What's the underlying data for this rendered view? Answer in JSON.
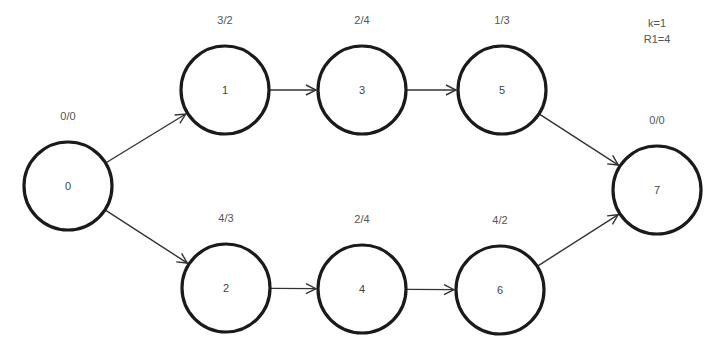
{
  "diagram": {
    "params": [
      {
        "text": "k=1",
        "x": 657,
        "y": 27
      },
      {
        "text": "R1=4",
        "x": 657,
        "y": 43
      }
    ],
    "nodes": [
      {
        "id": "0",
        "label": "0",
        "weights": "0/0",
        "cx": 68,
        "cy": 186
      },
      {
        "id": "1",
        "label": "1",
        "weights": "3/2",
        "cx": 225,
        "cy": 90
      },
      {
        "id": "3",
        "label": "3",
        "weights": "2/4",
        "cx": 362,
        "cy": 90
      },
      {
        "id": "5",
        "label": "5",
        "weights": "1/3",
        "cx": 502,
        "cy": 90
      },
      {
        "id": "2",
        "label": "2",
        "weights": "4/3",
        "cx": 226,
        "cy": 288
      },
      {
        "id": "4",
        "label": "4",
        "weights": "2/4",
        "cx": 362,
        "cy": 289
      },
      {
        "id": "6",
        "label": "6",
        "weights": "4/2",
        "cx": 500,
        "cy": 290
      },
      {
        "id": "7",
        "label": "7",
        "weights": "0/0",
        "cx": 657,
        "cy": 190
      }
    ],
    "edges": [
      {
        "from": "0",
        "to": "1"
      },
      {
        "from": "0",
        "to": "2"
      },
      {
        "from": "1",
        "to": "3"
      },
      {
        "from": "3",
        "to": "5"
      },
      {
        "from": "2",
        "to": "4"
      },
      {
        "from": "4",
        "to": "6"
      },
      {
        "from": "5",
        "to": "7"
      },
      {
        "from": "6",
        "to": "7"
      }
    ],
    "node_radius": 44,
    "colors": {
      "stroke": "#1a1a1a",
      "edge": "#333333",
      "text": "#555555",
      "background": "#ffffff"
    }
  }
}
